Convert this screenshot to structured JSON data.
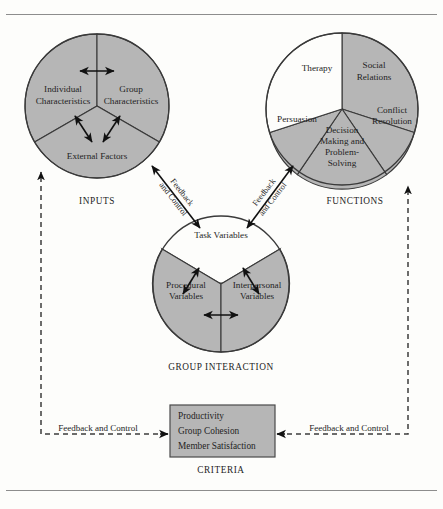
{
  "diagram": {
    "title_rules": {
      "top": "horizontal-rule",
      "bottom": "horizontal-rule"
    },
    "colors": {
      "sector_gray": "#b6b6b6",
      "sector_white": "#fdfdfb",
      "stroke": "#3a3a3a",
      "page_bg": "#fdfdfb",
      "criteria_fill": "#b6b6b6"
    },
    "inputs": {
      "caption": "INPUTS",
      "sectors": [
        {
          "label_line1": "Individual",
          "label_line2": "Characteristics",
          "fill": "gray"
        },
        {
          "label_line1": "Group",
          "label_line2": "Characteristics",
          "fill": "gray"
        },
        {
          "label_line1": "External Factors",
          "label_line2": "",
          "fill": "gray"
        }
      ]
    },
    "functions": {
      "caption": "FUNCTIONS",
      "sectors": [
        {
          "label_line1": "Social",
          "label_line2": "Relations",
          "label_line3": "",
          "label_line4": "",
          "fill": "gray"
        },
        {
          "label_line1": "Conflict",
          "label_line2": "Resolution",
          "label_line3": "",
          "label_line4": "",
          "fill": "gray"
        },
        {
          "label_line1": "Decision",
          "label_line2": "Making and",
          "label_line3": "Problem-",
          "label_line4": "Solving",
          "fill": "gray"
        },
        {
          "label_line1": "Persuasion",
          "label_line2": "",
          "label_line3": "",
          "label_line4": "",
          "fill": "gray"
        },
        {
          "label_line1": "Therapy",
          "label_line2": "",
          "label_line3": "",
          "label_line4": "",
          "fill": "white"
        }
      ]
    },
    "group_interaction": {
      "caption": "GROUP INTERACTION",
      "sectors": [
        {
          "label_line1": "Task Variables",
          "label_line2": "",
          "fill": "gray"
        },
        {
          "label_line1": "Procedural",
          "label_line2": "Variables",
          "fill": "gray"
        },
        {
          "label_line1": "Interpersonal",
          "label_line2": "Variables",
          "fill": "gray"
        }
      ]
    },
    "criteria": {
      "caption": "CRITERIA",
      "items": [
        "Productivity",
        "Group Cohesion",
        "Member Satisfaction"
      ]
    },
    "feedback_labels": {
      "left_diagonal_line1": "Feedback",
      "left_diagonal_line2": "and Control",
      "right_diagonal_line1": "Feedback",
      "right_diagonal_line2": "and Control",
      "bottom_left": "Feedback and Control",
      "bottom_right": "Feedback and Control"
    }
  }
}
